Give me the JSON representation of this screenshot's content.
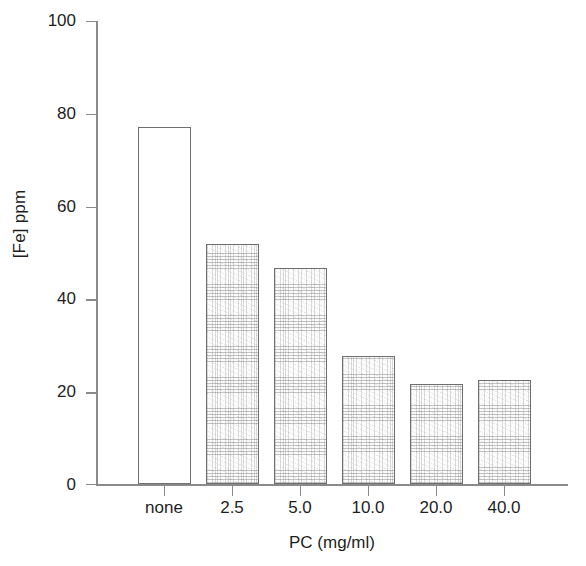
{
  "chart_data": {
    "type": "bar",
    "title": "",
    "subtitle": "",
    "xlabel": "PC (mg/ml)",
    "ylabel": "[Fe] ppm",
    "categories": [
      "none",
      "2.5",
      "5.0",
      "10.0",
      "20.0",
      "40.0"
    ],
    "values": [
      77.0,
      51.8,
      46.6,
      27.6,
      21.6,
      22.5
    ],
    "series": [
      {
        "name": "[Fe] ppm",
        "values": [
          77.0,
          51.8,
          46.6,
          27.6,
          21.6,
          22.5
        ]
      }
    ],
    "ylim": [
      0,
      100
    ],
    "ytick_values": [
      0,
      20,
      40,
      60,
      80,
      100
    ],
    "ytick_labels": [
      "0",
      "20",
      "40",
      "60",
      "80",
      "100"
    ],
    "grid": false,
    "legend": false,
    "legend_position": "none",
    "bar_fills": [
      "none",
      "stipple",
      "stipple",
      "stipple",
      "stipple",
      "stipple"
    ],
    "annotations": [],
    "colors": {
      "axis": "#8a8a8a",
      "bar_edge": "#6f6f6f",
      "bar_fill_empty": "#ffffff",
      "bar_fill_stipple": "#e8e8e8",
      "text": "#1e1e1e",
      "background": "#ffffff"
    }
  }
}
